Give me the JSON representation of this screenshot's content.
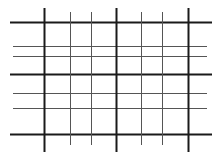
{
  "diagram": {
    "type": "grid",
    "canvas": {
      "width": 223,
      "height": 160,
      "background": "#ffffff"
    },
    "colors": {
      "major": "#1a1a1a",
      "minor": "#555555"
    },
    "vertical_lines": [
      {
        "x": 44,
        "weight": "major",
        "y1": 8,
        "y2": 152
      },
      {
        "x": 70,
        "weight": "minor",
        "y1": 12,
        "y2": 145
      },
      {
        "x": 91,
        "weight": "minor",
        "y1": 12,
        "y2": 145
      },
      {
        "x": 116,
        "weight": "major",
        "y1": 8,
        "y2": 152
      },
      {
        "x": 141,
        "weight": "minor",
        "y1": 12,
        "y2": 145
      },
      {
        "x": 162,
        "weight": "minor",
        "y1": 12,
        "y2": 145
      },
      {
        "x": 188,
        "weight": "major",
        "y1": 8,
        "y2": 152
      }
    ],
    "horizontal_lines": [
      {
        "y": 22,
        "weight": "major",
        "x1": 10,
        "x2": 212
      },
      {
        "y": 46,
        "weight": "minor",
        "x1": 13,
        "x2": 207
      },
      {
        "y": 56,
        "weight": "minor",
        "x1": 13,
        "x2": 207
      },
      {
        "y": 74,
        "weight": "major",
        "x1": 10,
        "x2": 212
      },
      {
        "y": 93,
        "weight": "minor",
        "x1": 13,
        "x2": 207
      },
      {
        "y": 108,
        "weight": "minor",
        "x1": 13,
        "x2": 207
      },
      {
        "y": 134,
        "weight": "major",
        "x1": 10,
        "x2": 212
      }
    ],
    "stroke_widths": {
      "major": 2,
      "minor": 1
    }
  }
}
